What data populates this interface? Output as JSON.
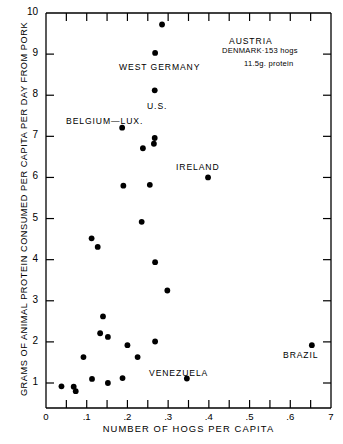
{
  "chart_data": {
    "type": "scatter",
    "title": "",
    "xlabel": "NUMBER OF HOGS PER CAPITA",
    "ylabel": "GRAMS OF ANIMAL PROTEIN CONSUMED PER CAPITA PER DAY FROM PORK",
    "xlim": [
      0,
      0.7
    ],
    "ylim": [
      0.4,
      10
    ],
    "grid": false,
    "legend": "none",
    "xticks": [
      {
        "value": 0,
        "label": "0",
        "major": true
      },
      {
        "value": 0.05,
        "label": "",
        "major": false
      },
      {
        "value": 0.1,
        "label": ".1",
        "major": true
      },
      {
        "value": 0.15,
        "label": "",
        "major": false
      },
      {
        "value": 0.2,
        "label": ".2",
        "major": true
      },
      {
        "value": 0.25,
        "label": "",
        "major": false
      },
      {
        "value": 0.3,
        "label": ".3",
        "major": true
      },
      {
        "value": 0.35,
        "label": "",
        "major": false
      },
      {
        "value": 0.4,
        "label": ".4",
        "major": true
      },
      {
        "value": 0.45,
        "label": "",
        "major": false
      },
      {
        "value": 0.5,
        "label": ".5",
        "major": true
      },
      {
        "value": 0.55,
        "label": "",
        "major": false
      },
      {
        "value": 0.6,
        "label": ".6",
        "major": true
      },
      {
        "value": 0.65,
        "label": "",
        "major": false
      },
      {
        "value": 0.7,
        "label": "7",
        "major": true
      }
    ],
    "yticks": [
      {
        "value": 1,
        "label": "1"
      },
      {
        "value": 2,
        "label": "2"
      },
      {
        "value": 3,
        "label": "3"
      },
      {
        "value": 4,
        "label": "4"
      },
      {
        "value": 5,
        "label": "5"
      },
      {
        "value": 6,
        "label": "6"
      },
      {
        "value": 7,
        "label": "7"
      },
      {
        "value": 8,
        "label": "8"
      },
      {
        "value": 9,
        "label": "9"
      },
      {
        "value": 10,
        "label": "10"
      }
    ],
    "points": [
      {
        "x": 0.285,
        "y": 9.72,
        "label": "AUSTRIA"
      },
      {
        "x": 0.268,
        "y": 9.03,
        "label": "WEST GERMANY"
      },
      {
        "x": 0.267,
        "y": 8.12,
        "label": "U.S."
      },
      {
        "x": 0.187,
        "y": 7.21,
        "label": "BELGIUM-LUX."
      },
      {
        "x": 0.267,
        "y": 6.96,
        "label": ""
      },
      {
        "x": 0.265,
        "y": 6.82,
        "label": ""
      },
      {
        "x": 0.238,
        "y": 6.71,
        "label": ""
      },
      {
        "x": 0.398,
        "y": 6.0,
        "label": "IRELAND"
      },
      {
        "x": 0.19,
        "y": 5.8,
        "label": ""
      },
      {
        "x": 0.255,
        "y": 5.82,
        "label": ""
      },
      {
        "x": 0.235,
        "y": 4.92,
        "label": ""
      },
      {
        "x": 0.112,
        "y": 4.52,
        "label": ""
      },
      {
        "x": 0.127,
        "y": 4.31,
        "label": ""
      },
      {
        "x": 0.268,
        "y": 3.94,
        "label": ""
      },
      {
        "x": 0.298,
        "y": 3.25,
        "label": ""
      },
      {
        "x": 0.14,
        "y": 2.62,
        "label": ""
      },
      {
        "x": 0.133,
        "y": 2.21,
        "label": ""
      },
      {
        "x": 0.152,
        "y": 2.12,
        "label": ""
      },
      {
        "x": 0.653,
        "y": 1.92,
        "label": "BRAZIL"
      },
      {
        "x": 0.268,
        "y": 2.01,
        "label": ""
      },
      {
        "x": 0.2,
        "y": 1.92,
        "label": ""
      },
      {
        "x": 0.225,
        "y": 1.63,
        "label": ""
      },
      {
        "x": 0.092,
        "y": 1.63,
        "label": ""
      },
      {
        "x": 0.113,
        "y": 1.1,
        "label": ""
      },
      {
        "x": 0.188,
        "y": 1.12,
        "label": ""
      },
      {
        "x": 0.346,
        "y": 1.11,
        "label": "VENEZUELA"
      },
      {
        "x": 0.152,
        "y": 1.0,
        "label": ""
      },
      {
        "x": 0.038,
        "y": 0.92,
        "label": ""
      },
      {
        "x": 0.068,
        "y": 0.91,
        "label": ""
      },
      {
        "x": 0.073,
        "y": 0.8,
        "label": ""
      }
    ],
    "annotations": [
      {
        "name": "austria",
        "text": "AUSTRIA",
        "x": 229,
        "y": 36,
        "size": "normal"
      },
      {
        "name": "west-germany",
        "text": "WEST GERMANY",
        "x": 119,
        "y": 62,
        "size": "normal"
      },
      {
        "name": "us",
        "text": "U.S.",
        "x": 147,
        "y": 101,
        "size": "normal"
      },
      {
        "name": "belgium-lux",
        "text": "BELGIUM—LUX.",
        "x": 66,
        "y": 116,
        "size": "normal"
      },
      {
        "name": "ireland",
        "text": "IRELAND",
        "x": 176,
        "y": 162,
        "size": "normal"
      },
      {
        "name": "denmark-hogs",
        "text": "DENMARK·153 hogs",
        "x": 222,
        "y": 46,
        "size": "small"
      },
      {
        "name": "denmark-protein",
        "text": "11.5g. protein",
        "x": 244,
        "y": 59,
        "size": "small"
      },
      {
        "name": "venezuela",
        "text": "VENEZUELA",
        "x": 149,
        "y": 368,
        "size": "normal"
      },
      {
        "name": "brazil",
        "text": "BRAZIL",
        "x": 283,
        "y": 350,
        "size": "normal"
      }
    ]
  }
}
